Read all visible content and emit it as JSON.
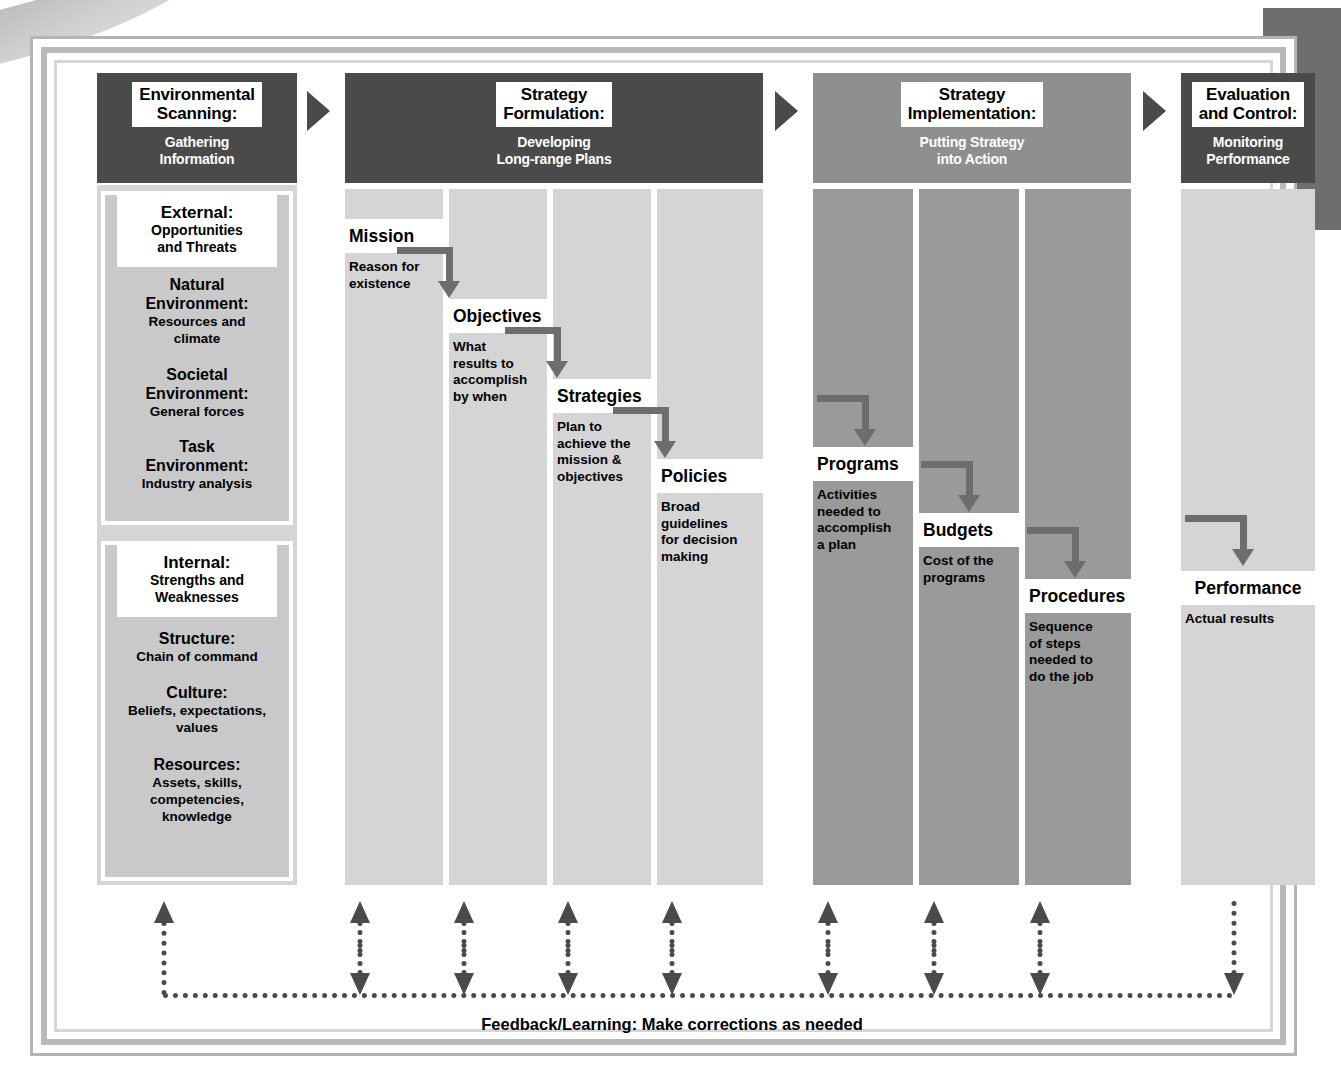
{
  "diagram": {
    "colors": {
      "header_dark": "#4a4a4a",
      "header_mid": "#8f8f8f",
      "column_light": "#d5d5d5",
      "column_mid": "#9a9a9a",
      "panel": "#c9c9c9",
      "arrow": "#6d6d6d",
      "frame": "#b9b9b9",
      "tab": "#6e6e6e"
    },
    "sections": [
      {
        "id": "environmental-scanning",
        "title": "Environmental\nScanning:",
        "title_line1": "Environmental",
        "title_line2": "Scanning:",
        "subtitle_line1": "Gathering",
        "subtitle_line2": "Information",
        "header_style": "dark"
      },
      {
        "id": "strategy-formulation",
        "title_line1": "Strategy",
        "title_line2": "Formulation:",
        "subtitle_line1": "Developing",
        "subtitle_line2": "Long-range Plans",
        "header_style": "dark"
      },
      {
        "id": "strategy-implementation",
        "title_line1": "Strategy",
        "title_line2": "Implementation:",
        "subtitle_line1": "Putting Strategy",
        "subtitle_line2": "into Action",
        "header_style": "mid"
      },
      {
        "id": "evaluation-and-control",
        "title_line1": "Evaluation",
        "title_line2": "and Control:",
        "subtitle_line1": "Monitoring",
        "subtitle_line2": "Performance",
        "header_style": "dark"
      }
    ],
    "scanning": {
      "external_panel": {
        "title": "External:",
        "sub_line1": "Opportunities",
        "sub_line2": "and Threats"
      },
      "external_groups": [
        {
          "heading_line1": "Natural",
          "heading_line2": "Environment:",
          "body_line1": "Resources and",
          "body_line2": "climate"
        },
        {
          "heading_line1": "Societal",
          "heading_line2": "Environment:",
          "body_line1": "General forces",
          "body_line2": ""
        },
        {
          "heading_line1": "Task",
          "heading_line2": "Environment:",
          "body_line1": "Industry analysis",
          "body_line2": ""
        }
      ],
      "internal_panel": {
        "title": "Internal:",
        "sub_line1": "Strengths and",
        "sub_line2": "Weaknesses"
      },
      "internal_groups": [
        {
          "heading_line1": "Structure:",
          "heading_line2": "",
          "body_line1": "Chain of command",
          "body_line2": "",
          "body_line3": ""
        },
        {
          "heading_line1": "Culture:",
          "heading_line2": "",
          "body_line1": "Beliefs, expectations,",
          "body_line2": "values",
          "body_line3": ""
        },
        {
          "heading_line1": "Resources:",
          "heading_line2": "",
          "body_line1": "Assets, skills,",
          "body_line2": "competencies,",
          "body_line3": "knowledge"
        }
      ]
    },
    "formulation_steps": [
      {
        "label": "Mission",
        "desc_line1": "Reason for",
        "desc_line2": "existence",
        "desc_line3": "",
        "desc_line4": ""
      },
      {
        "label": "Objectives",
        "desc_line1": "What",
        "desc_line2": "results to",
        "desc_line3": "accomplish",
        "desc_line4": "by when"
      },
      {
        "label": "Strategies",
        "desc_line1": "Plan to",
        "desc_line2": "achieve the",
        "desc_line3": "mission &",
        "desc_line4": "objectives"
      },
      {
        "label": "Policies",
        "desc_line1": "Broad",
        "desc_line2": "guidelines",
        "desc_line3": "for decision",
        "desc_line4": "making"
      }
    ],
    "implementation_steps": [
      {
        "label": "Programs",
        "desc_line1": "Activities",
        "desc_line2": "needed to",
        "desc_line3": "accomplish",
        "desc_line4": "a plan"
      },
      {
        "label": "Budgets",
        "desc_line1": "Cost of the",
        "desc_line2": "programs",
        "desc_line3": "",
        "desc_line4": ""
      },
      {
        "label": "Procedures",
        "desc_line1": "Sequence",
        "desc_line2": "of steps",
        "desc_line3": "needed to",
        "desc_line4": "do the job"
      }
    ],
    "evaluation_steps": [
      {
        "label": "Performance",
        "desc_line1": "Actual results",
        "desc_line2": "",
        "desc_line3": "",
        "desc_line4": ""
      }
    ],
    "feedback": {
      "caption": "Feedback/Learning: Make corrections as needed"
    }
  }
}
